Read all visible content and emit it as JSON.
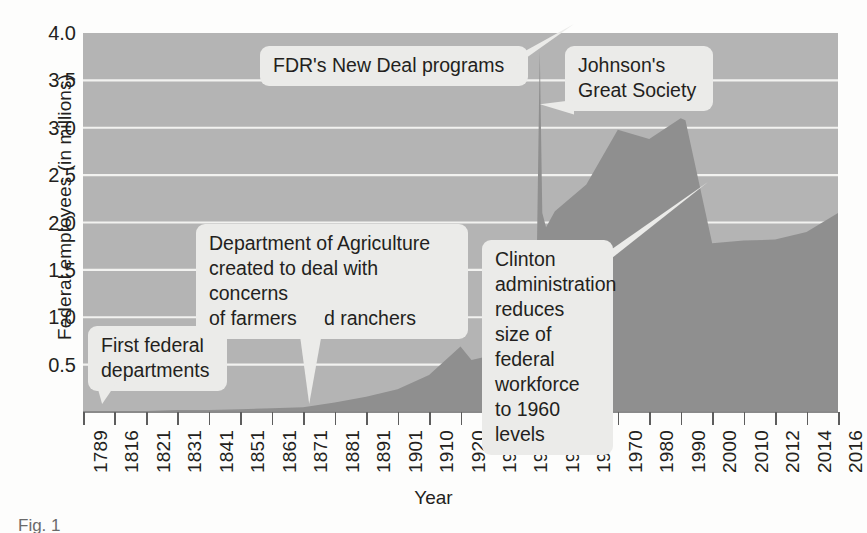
{
  "chart_data": {
    "type": "area",
    "title": "",
    "xlabel": "Year",
    "ylabel": "Federal employees (in millions)",
    "ylim": [
      0,
      4.0
    ],
    "y_ticks": [
      "0.5",
      "1.0",
      "1.5",
      "2.0",
      "2.5",
      "3.0",
      "3.5",
      "4.0"
    ],
    "y_tick_values": [
      0.5,
      1.0,
      1.5,
      2.0,
      2.5,
      3.0,
      3.5,
      4.0
    ],
    "grid": "horizontal",
    "legend": "none",
    "plot_background_color": "#b4b4b4",
    "area_fill_color": "#8f8f8f",
    "gridline_color": "#f2f2f0",
    "categories": [
      "1789",
      "1816",
      "1821",
      "1831",
      "1841",
      "1851",
      "1861",
      "1871",
      "1881",
      "1891",
      "1901",
      "1910",
      "1920",
      "1930",
      "1940",
      "1950",
      "1960",
      "1970",
      "1980",
      "1990",
      "2000",
      "2010",
      "2012",
      "2014",
      "2016"
    ],
    "values": [
      0.0,
      0.01,
      0.01,
      0.02,
      0.02,
      0.03,
      0.04,
      0.05,
      0.1,
      0.16,
      0.24,
      0.39,
      0.69,
      0.6,
      1.04,
      2.12,
      2.4,
      2.98,
      2.88,
      3.1,
      1.78,
      1.81,
      1.82,
      1.9,
      2.1
    ],
    "annotations": [
      {
        "name": "first-federal-departments",
        "text": "First federal\ndepartments",
        "target_year": "1789"
      },
      {
        "name": "department-of-agriculture",
        "text": "Department of Agriculture\ncreated to deal with concerns\nof farmers and ranchers",
        "target_year": "1862"
      },
      {
        "name": "fdrs-new-deal",
        "text": "FDR's New Deal programs",
        "target_year": "1940"
      },
      {
        "name": "johnsons-great-society",
        "text": "Johnson's\nGreat Society",
        "target_year": "1965"
      },
      {
        "name": "clinton-administration",
        "text": "Clinton\nadministration\nreduces size of\nfederal workforce\nto 1960 levels",
        "target_year": "1998"
      }
    ]
  },
  "axes": {
    "y_title": "Federal employees (in millions)",
    "x_title": "Year"
  },
  "callouts": {
    "first_federal": "First federal\ndepartments",
    "agriculture": "Department of Agriculture\ncreated to deal with concerns\nof farmers and ranchers",
    "new_deal": "FDR's New Deal programs",
    "great_society": "Johnson's\nGreat Society",
    "clinton": "Clinton\nadministration\nreduces size of\nfederal workforce\nto 1960 levels"
  },
  "caption": {
    "text": "Fig. 1"
  }
}
